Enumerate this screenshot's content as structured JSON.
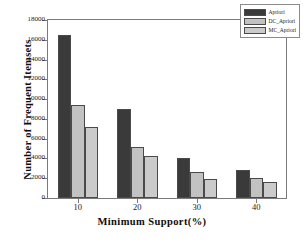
{
  "chart_data": {
    "type": "bar",
    "title": "",
    "xlabel": "Minimum Support(%)",
    "ylabel": "Number of Frequent Itemsets",
    "categories": [
      "10",
      "20",
      "30",
      "40"
    ],
    "series": [
      {
        "name": "Apriori",
        "values": [
          16500,
          9050,
          4050,
          2850
        ],
        "color": "#3a3a3a"
      },
      {
        "name": "DC_Apriori",
        "values": [
          9400,
          5150,
          2600,
          2050
        ],
        "color": "#c2c2c2"
      },
      {
        "name": "MC_Apriori",
        "values": [
          7200,
          4200,
          1950,
          1650
        ],
        "color": "#cbcbcb"
      }
    ],
    "ylim": [
      0,
      18000
    ],
    "yticks": [
      0,
      2000,
      4000,
      6000,
      8000,
      10000,
      12000,
      14000,
      16000,
      18000
    ],
    "ytick_labels": [
      "0",
      "2000",
      "4000",
      "6000",
      "8000",
      "10000",
      "12000",
      "14000",
      "16000",
      "18000"
    ],
    "grid": false,
    "legend_position": "top-right"
  },
  "legend": {
    "entries": [
      {
        "label": "Apriori"
      },
      {
        "label": "DC_Apriori"
      },
      {
        "label": "MC_Apriori"
      }
    ]
  }
}
